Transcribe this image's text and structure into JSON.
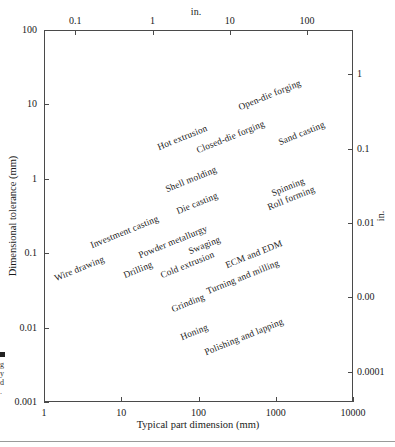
{
  "chart_data": {
    "type": "scatter",
    "title": "",
    "xlabel": "Typical part dimension (mm)",
    "ylabel": "Dimensional tolerance (mm)",
    "xlabel_top": "in.",
    "ylabel_right": "in.",
    "scale": "log-log",
    "grid": false,
    "legend": "none",
    "xlim": [
      1,
      10000
    ],
    "ylim": [
      0.001,
      100
    ],
    "x_ticks": [
      "1",
      "10",
      "100",
      "1000",
      "10000"
    ],
    "x_tick_values": [
      1,
      10,
      100,
      1000,
      10000
    ],
    "y_ticks": [
      "100",
      "10",
      "1",
      "0.1",
      "0.01",
      "0.001"
    ],
    "y_tick_values": [
      100,
      10,
      1,
      0.1,
      0.01,
      0.001
    ],
    "x_ticks_top": [
      "0.1",
      "1",
      "10",
      "100"
    ],
    "x_tick_top_values": [
      2.54,
      25.4,
      254,
      2540
    ],
    "y_ticks_right": [
      "1",
      "0.1",
      "0.01",
      "0.00",
      "0.0001"
    ],
    "y_tick_right_values": [
      25.4,
      2.54,
      0.254,
      0.0254,
      0.00254
    ],
    "annotations": [
      {
        "label": "Hot extrusion",
        "x": 30,
        "y": 2.6,
        "angle": -22
      },
      {
        "label": "Open-die forging",
        "x": 330,
        "y": 9.0,
        "angle": -22
      },
      {
        "label": "Closed-die forging",
        "x": 95,
        "y": 2.4,
        "angle": -22
      },
      {
        "label": "Sand casting",
        "x": 1100,
        "y": 3.0,
        "angle": -22
      },
      {
        "label": "Shell molding",
        "x": 38,
        "y": 0.7,
        "angle": -22
      },
      {
        "label": "Die casting",
        "x": 52,
        "y": 0.36,
        "angle": -22
      },
      {
        "label": "Spinning",
        "x": 900,
        "y": 0.62,
        "angle": -22
      },
      {
        "label": "Roll forming",
        "x": 800,
        "y": 0.4,
        "angle": -22
      },
      {
        "label": "Investment casting",
        "x": 4.0,
        "y": 0.125,
        "angle": -22
      },
      {
        "label": "Powder metallurgy",
        "x": 17,
        "y": 0.092,
        "angle": -22
      },
      {
        "label": "Swaging",
        "x": 75,
        "y": 0.105,
        "angle": -22
      },
      {
        "label": "Wire drawing",
        "x": 1.4,
        "y": 0.045,
        "angle": -22
      },
      {
        "label": "Drilling",
        "x": 11,
        "y": 0.05,
        "angle": -22
      },
      {
        "label": "Cold extrusion",
        "x": 33,
        "y": 0.05,
        "angle": -22
      },
      {
        "label": "ECM and EDM",
        "x": 230,
        "y": 0.068,
        "angle": -22
      },
      {
        "label": "Turning and milling",
        "x": 130,
        "y": 0.03,
        "angle": -22
      },
      {
        "label": "Grinding",
        "x": 45,
        "y": 0.0175,
        "angle": -22
      },
      {
        "label": "Honing",
        "x": 60,
        "y": 0.0072,
        "angle": -22
      },
      {
        "label": "Polishing and lapping",
        "x": 120,
        "y": 0.0045,
        "angle": -22
      }
    ]
  },
  "caption_fragment": {
    "marker": "",
    "lines": [
      "",
      "",
      "g",
      "y",
      "d",
      "."
    ]
  }
}
